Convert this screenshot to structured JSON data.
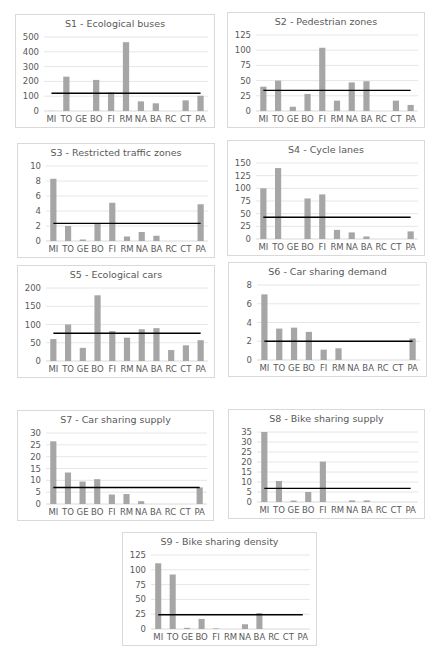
{
  "colors": {
    "bar": "#a6a6a6",
    "avg_line": "#000000",
    "grid": "#e6e6e6",
    "text": "#595959",
    "border": "#d9d9d9"
  },
  "chart_data": [
    {
      "id": "s1",
      "type": "bar",
      "title": "S1 - Ecological buses",
      "categories": [
        "MI",
        "TO",
        "GE",
        "BO",
        "FI",
        "RM",
        "NA",
        "BA",
        "RC",
        "CT",
        "PA"
      ],
      "values": [
        1,
        232,
        0,
        210,
        125,
        465,
        65,
        52,
        0,
        72,
        103
      ],
      "average": 120,
      "yticks": [
        0,
        100,
        200,
        300,
        400,
        500
      ],
      "ylim": [
        0,
        500
      ],
      "grid": true,
      "legend": "none",
      "box": {
        "x": 15,
        "y": 14,
        "w": 200,
        "h": 114
      }
    },
    {
      "id": "s2",
      "type": "bar",
      "title": "S2 - Pedestrian zones",
      "categories": [
        "MI",
        "TO",
        "GE",
        "BO",
        "FI",
        "RM",
        "NA",
        "BA",
        "RC",
        "CT",
        "PA"
      ],
      "values": [
        40,
        50,
        7,
        28,
        104,
        17,
        47,
        49,
        0,
        17,
        10
      ],
      "average": 34,
      "yticks": [
        0,
        25,
        50,
        75,
        100,
        125
      ],
      "ylim": [
        0,
        125
      ],
      "grid": true,
      "legend": "none",
      "box": {
        "x": 227,
        "y": 12,
        "w": 198,
        "h": 116
      }
    },
    {
      "id": "s3",
      "type": "bar",
      "title": "S3 - Restricted traffic zones",
      "categories": [
        "MI",
        "TO",
        "GE",
        "BO",
        "FI",
        "RM",
        "NA",
        "BA",
        "RC",
        "CT",
        "PA"
      ],
      "values": [
        8.3,
        2.0,
        0.2,
        2.3,
        5.1,
        0.6,
        1.2,
        0.7,
        0,
        0,
        4.9
      ],
      "average": 2.35,
      "yticks": [
        0,
        2,
        4,
        6,
        8,
        10
      ],
      "ylim": [
        0,
        10
      ],
      "grid": true,
      "legend": "none",
      "box": {
        "x": 17,
        "y": 143,
        "w": 198,
        "h": 115
      }
    },
    {
      "id": "s4",
      "type": "bar",
      "title": "S4 - Cycle lanes",
      "categories": [
        "MI",
        "TO",
        "GE",
        "BO",
        "FI",
        "RM",
        "NA",
        "BA",
        "RC",
        "CT",
        "PA"
      ],
      "values": [
        100,
        140,
        0,
        80,
        88,
        18,
        13,
        5,
        0,
        0,
        15
      ],
      "average": 43,
      "yticks": [
        0,
        25,
        50,
        75,
        100,
        125,
        150
      ],
      "ylim": [
        0,
        150
      ],
      "grid": true,
      "legend": "none",
      "box": {
        "x": 227,
        "y": 140,
        "w": 198,
        "h": 116
      }
    },
    {
      "id": "s5",
      "type": "bar",
      "title": "S5 - Ecological cars",
      "categories": [
        "MI",
        "TO",
        "GE",
        "BO",
        "FI",
        "RM",
        "NA",
        "BA",
        "RC",
        "CT",
        "PA"
      ],
      "values": [
        60,
        100,
        36,
        180,
        82,
        64,
        87,
        90,
        30,
        43,
        57
      ],
      "average": 76,
      "yticks": [
        0,
        50,
        100,
        150,
        200
      ],
      "ylim": [
        0,
        200
      ],
      "grid": true,
      "legend": "none",
      "box": {
        "x": 17,
        "y": 265,
        "w": 198,
        "h": 113
      }
    },
    {
      "id": "s6",
      "type": "bar",
      "title": "S6 - Car sharing demand",
      "categories": [
        "MI",
        "TO",
        "GE",
        "BO",
        "FI",
        "RM",
        "NA",
        "BA",
        "RC",
        "CT",
        "PA"
      ],
      "values": [
        7.0,
        3.35,
        3.45,
        3.0,
        1.1,
        1.25,
        0,
        0,
        0,
        0,
        2.3
      ],
      "average": 2.0,
      "yticks": [
        0,
        2,
        4,
        6,
        8
      ],
      "ylim": [
        0,
        8
      ],
      "grid": true,
      "legend": "none",
      "box": {
        "x": 228,
        "y": 262,
        "w": 199,
        "h": 115
      }
    },
    {
      "id": "s7",
      "type": "bar",
      "title": "S7 - Car sharing supply",
      "categories": [
        "MI",
        "TO",
        "GE",
        "BO",
        "FI",
        "RM",
        "NA",
        "BA",
        "RC",
        "CT",
        "PA"
      ],
      "values": [
        26.5,
        13.3,
        9.5,
        10.5,
        4.0,
        4.2,
        1.2,
        0,
        0,
        0,
        7.0
      ],
      "average": 7.0,
      "yticks": [
        0,
        5,
        10,
        15,
        20,
        25,
        30
      ],
      "ylim": [
        0,
        30
      ],
      "grid": true,
      "legend": "none",
      "box": {
        "x": 17,
        "y": 410,
        "w": 197,
        "h": 111
      }
    },
    {
      "id": "s8",
      "type": "bar",
      "title": "S8 - Bike sharing supply",
      "categories": [
        "MI",
        "TO",
        "GE",
        "BO",
        "FI",
        "RM",
        "NA",
        "BA",
        "RC",
        "CT",
        "PA"
      ],
      "values": [
        35,
        10.5,
        0.7,
        5.0,
        20.2,
        0,
        0.8,
        0.8,
        0,
        0,
        0
      ],
      "average": 6.8,
      "yticks": [
        0,
        5,
        10,
        15,
        20,
        25,
        30,
        35
      ],
      "ylim": [
        0,
        35
      ],
      "grid": true,
      "legend": "none",
      "box": {
        "x": 228,
        "y": 409,
        "w": 197,
        "h": 110
      }
    },
    {
      "id": "s9",
      "type": "bar",
      "title": "S9 - Bike sharing density",
      "categories": [
        "MI",
        "TO",
        "GE",
        "BO",
        "FI",
        "RM",
        "NA",
        "BA",
        "RC",
        "CT",
        "PA"
      ],
      "values": [
        111,
        92,
        2,
        17,
        1,
        0,
        8,
        27,
        0,
        0,
        0
      ],
      "average": 24,
      "yticks": [
        0,
        25,
        50,
        75,
        100,
        125
      ],
      "ylim": [
        0,
        125
      ],
      "grid": true,
      "legend": "none",
      "box": {
        "x": 122,
        "y": 532,
        "w": 195,
        "h": 114
      }
    }
  ]
}
